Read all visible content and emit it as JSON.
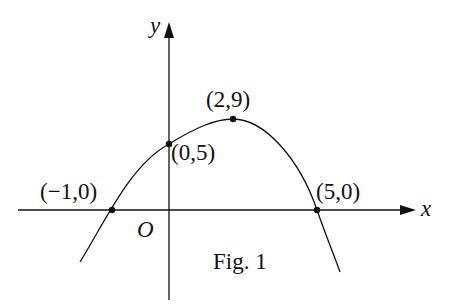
{
  "figure": {
    "caption": "Fig. 1",
    "axes": {
      "x_label": "x",
      "y_label": "y",
      "origin_label": "O"
    },
    "curve": "downward-opening parabola",
    "points": [
      {
        "label": "(−1,0)",
        "x": -1,
        "y": 0
      },
      {
        "label": "(0,5)",
        "x": 0,
        "y": 5
      },
      {
        "label": "(2,9)",
        "x": 2,
        "y": 9
      },
      {
        "label": "(5,0)",
        "x": 5,
        "y": 0
      }
    ],
    "colors": {
      "ink": "#111111",
      "background": "#ffffff"
    }
  }
}
